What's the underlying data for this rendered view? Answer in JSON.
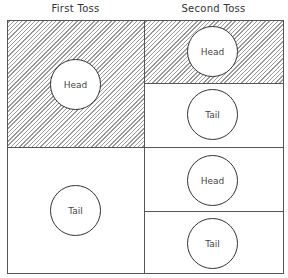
{
  "headers": {
    "first_toss": "First Toss",
    "second_toss": "Second Toss"
  },
  "first_toss": [
    {
      "label": "Head",
      "shaded": true
    },
    {
      "label": "Tail",
      "shaded": false
    }
  ],
  "second_toss": [
    {
      "label": "Head",
      "shaded": true
    },
    {
      "label": "Tail",
      "shaded": false
    },
    {
      "label": "Head",
      "shaded": false
    },
    {
      "label": "Tail",
      "shaded": false
    }
  ]
}
